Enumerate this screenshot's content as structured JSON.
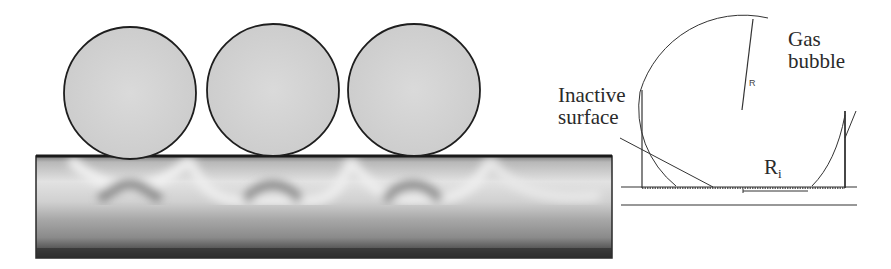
{
  "figure": {
    "left_panel": {
      "description": "Simulation of three gas bubbles on an electrode surface with concentration field shading",
      "bubble_count": 3,
      "colors": {
        "bubble_fill": "#d4d4d4",
        "bubble_stroke": "#222222",
        "field_dark": "#3a3a3a",
        "field_light": "#e6e6e6"
      }
    },
    "right_panel": {
      "labels": {
        "gas_bubble_line1": "Gas",
        "gas_bubble_line2": "bubble",
        "inactive_line1": "Inactive",
        "inactive_line2": "surface",
        "radius": "R",
        "inner_radius_main": "R",
        "inner_radius_sub": "i"
      }
    }
  }
}
